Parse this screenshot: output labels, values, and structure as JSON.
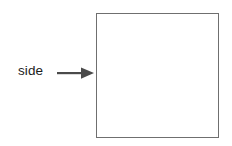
{
  "figure": {
    "type": "geometry-diagram",
    "background_color": "#ffffff",
    "label": {
      "text": "side",
      "color": "#1c1c1c",
      "font_size_px": 13.5
    },
    "arrow": {
      "name": "right-arrow",
      "direction": "right",
      "color": "#4a4a4a",
      "shaft_thickness_px": 2,
      "points_to": "square-left-side"
    },
    "shape": {
      "name": "square",
      "sides": 4,
      "stroke_color": "#6f6f6f",
      "stroke_width_px": 1,
      "fill_color": "#ffffff",
      "width_px": 123,
      "height_px": 125
    }
  }
}
